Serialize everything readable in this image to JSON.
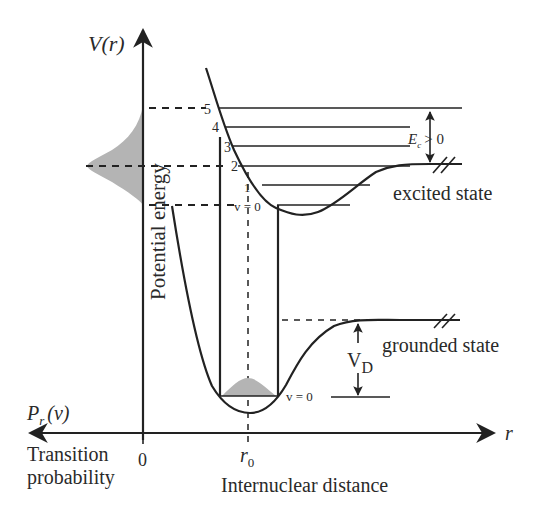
{
  "diagram": {
    "type": "potential-energy-curves",
    "y_axis": {
      "label": "V(r)",
      "side_label": "Potential energy"
    },
    "x_axis": {
      "label": "r",
      "bottom_label": "Internuclear distance",
      "tick_r0": "r",
      "tick_r0_sub": "0",
      "origin": "0"
    },
    "left_axis": {
      "label": "P",
      "label_sub": "r",
      "label_arg": "(v)",
      "caption_line1": "Transition",
      "caption_line2": "probability"
    },
    "excited_state": {
      "label": "excited state",
      "vibrational_levels": [
        "5",
        "4",
        "3",
        "2",
        "1",
        "v = 0"
      ],
      "energy_annotation": {
        "symbol": "E",
        "sub": "c",
        "relation": "> 0"
      }
    },
    "ground_state": {
      "label": "grounded state",
      "vibrational_level": "v = 0",
      "dissociation_label": "V",
      "dissociation_sub": "D"
    },
    "colors": {
      "line": "#222222",
      "shade": "#b4b4b4",
      "background": "#ffffff"
    }
  }
}
